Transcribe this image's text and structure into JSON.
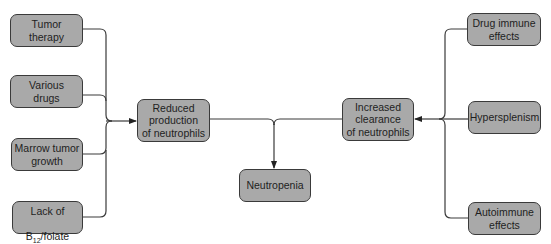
{
  "diagram": {
    "type": "flowchart",
    "colors": {
      "box_fill": "#a9a9a9",
      "box_border": "#3a3a3a",
      "line": "#3a3a3a",
      "background": "#ffffff"
    },
    "nodes": {
      "tumor_therapy": {
        "label": "Tumor\ntherapy"
      },
      "various_drugs": {
        "label": "Various\ndrugs"
      },
      "marrow_tumor_growth": {
        "label": "Marrow tumor\ngrowth"
      },
      "lack_b12_folate": {
        "label_line1": "Lack of",
        "label_b": "B",
        "label_sub": "12",
        "label_rest": "/folate"
      },
      "reduced_production": {
        "label": "Reduced\nproduction\nof neutrophils"
      },
      "neutropenia": {
        "label": "Neutropenia"
      },
      "increased_clearance": {
        "label": "Increased\nclearance\nof neutrophils"
      },
      "drug_immune_effects": {
        "label": "Drug immune\neffects"
      },
      "hypersplenism": {
        "label": "Hypersplenism"
      },
      "autoimmune_effects": {
        "label": "Autoimmune\neffects"
      }
    },
    "edges": [
      {
        "from": [
          "tumor_therapy",
          "various_drugs",
          "marrow_tumor_growth",
          "lack_b12_folate"
        ],
        "to": "reduced_production"
      },
      {
        "from": [
          "drug_immune_effects",
          "hypersplenism",
          "autoimmune_effects"
        ],
        "to": "increased_clearance"
      },
      {
        "from": [
          "reduced_production",
          "increased_clearance"
        ],
        "to": "neutropenia"
      }
    ]
  }
}
